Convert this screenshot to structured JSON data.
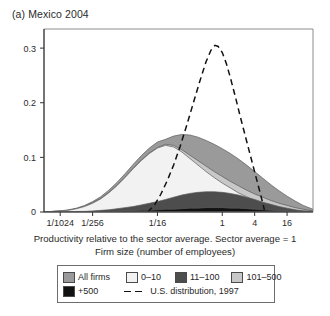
{
  "figure": {
    "panel_title": "(a) Mexico 2004",
    "caption_line1": "Productivity relative to the sector average. Sector average = 1",
    "caption_line2": "Firm size (number of employees)"
  },
  "legend": {
    "rows": [
      [
        {
          "label": "All firms",
          "swatch": "#9a9a9a",
          "type": "area"
        },
        {
          "label": "0–10",
          "swatch": "#f2f2f2",
          "type": "area"
        },
        {
          "label": "11–100",
          "swatch": "#4d4d4d",
          "type": "area"
        },
        {
          "label": "101–500",
          "swatch": "#c8c8c8",
          "type": "area"
        }
      ],
      [
        {
          "label": "+500",
          "swatch": "#111111",
          "type": "area"
        },
        {
          "label": "U.S. distribution, 1997",
          "swatch": "#111111",
          "type": "dashed-line"
        }
      ]
    ]
  },
  "chart_data": {
    "type": "area",
    "title": "(a) Mexico 2004",
    "xlabel": "Productivity relative to the sector average. Sector average = 1",
    "ylabel": "",
    "x_scale": "log2",
    "x_tick_labels": [
      "1/1024",
      "1/256",
      "1/16",
      "1",
      "4",
      "16"
    ],
    "x_tick_values": [
      0.0009765625,
      0.00390625,
      0.0625,
      1,
      4,
      16
    ],
    "x_tick_log2": [
      -10,
      -8,
      -4,
      0,
      2,
      4
    ],
    "xlim_log2": [
      -11,
      5.6
    ],
    "y_tick_labels": [
      "0",
      "0.1",
      "0.2",
      "0.3"
    ],
    "y_tick_values": [
      0,
      0.1,
      0.2,
      0.3
    ],
    "ylim": [
      0,
      0.335
    ],
    "grid": false,
    "legend_position": "below-axes",
    "x_log2": [
      -11,
      -10.5,
      -10,
      -9.5,
      -9,
      -8.5,
      -8,
      -7.5,
      -7,
      -6.5,
      -6,
      -5.5,
      -5,
      -4.5,
      -4,
      -3.5,
      -3,
      -2.5,
      -2,
      -1.5,
      -1,
      -0.5,
      0,
      0.5,
      1,
      1.5,
      2,
      2.5,
      3,
      3.5,
      4,
      4.5,
      5,
      5.6
    ],
    "series": [
      {
        "name": "All firms",
        "color": "#9a9a9a",
        "values": [
          0.0,
          0.001,
          0.002,
          0.004,
          0.007,
          0.012,
          0.019,
          0.028,
          0.04,
          0.054,
          0.07,
          0.087,
          0.103,
          0.117,
          0.128,
          0.133,
          0.139,
          0.142,
          0.141,
          0.137,
          0.131,
          0.124,
          0.116,
          0.107,
          0.097,
          0.086,
          0.074,
          0.062,
          0.05,
          0.039,
          0.029,
          0.02,
          0.012,
          0.005
        ]
      },
      {
        "name": "101–500",
        "color": "#c8c8c8",
        "values": [
          0.0,
          0.001,
          0.002,
          0.003,
          0.006,
          0.01,
          0.017,
          0.025,
          0.036,
          0.049,
          0.064,
          0.08,
          0.095,
          0.108,
          0.118,
          0.124,
          0.122,
          0.114,
          0.104,
          0.094,
          0.084,
          0.074,
          0.065,
          0.056,
          0.048,
          0.04,
          0.033,
          0.027,
          0.021,
          0.016,
          0.012,
          0.008,
          0.005,
          0.002
        ]
      },
      {
        "name": "0–10",
        "color": "#f2f2f2",
        "values": [
          0.0,
          0.001,
          0.002,
          0.003,
          0.006,
          0.01,
          0.016,
          0.024,
          0.035,
          0.048,
          0.063,
          0.079,
          0.094,
          0.107,
          0.117,
          0.122,
          0.119,
          0.11,
          0.098,
          0.086,
          0.074,
          0.063,
          0.053,
          0.044,
          0.035,
          0.028,
          0.021,
          0.016,
          0.011,
          0.008,
          0.005,
          0.003,
          0.002,
          0.001
        ]
      },
      {
        "name": "11–100",
        "color": "#4d4d4d",
        "values": [
          0.0,
          0.0,
          0.0,
          0.0,
          0.001,
          0.001,
          0.002,
          0.003,
          0.004,
          0.006,
          0.008,
          0.01,
          0.013,
          0.016,
          0.019,
          0.023,
          0.027,
          0.031,
          0.034,
          0.036,
          0.037,
          0.037,
          0.036,
          0.034,
          0.031,
          0.027,
          0.023,
          0.018,
          0.014,
          0.01,
          0.007,
          0.004,
          0.002,
          0.001
        ]
      },
      {
        "name": "+500",
        "color": "#111111",
        "values": [
          0.0,
          0.0,
          0.0,
          0.0,
          0.0,
          0.0,
          0.0,
          0.001,
          0.001,
          0.001,
          0.002,
          0.002,
          0.003,
          0.003,
          0.004,
          0.005,
          0.005,
          0.006,
          0.007,
          0.007,
          0.008,
          0.008,
          0.008,
          0.007,
          0.007,
          0.006,
          0.005,
          0.004,
          0.003,
          0.002,
          0.002,
          0.001,
          0.001,
          0.0
        ]
      }
    ],
    "dashed_series": {
      "name": "U.S. distribution, 1997",
      "color": "#111111",
      "style": "dashed",
      "x_log2": [
        -4.6,
        -4.2,
        -3.8,
        -3.4,
        -3.0,
        -2.6,
        -2.2,
        -1.8,
        -1.4,
        -1.0,
        -0.7,
        -0.45,
        -0.25,
        0.0,
        0.25,
        0.5,
        0.8,
        1.1,
        1.45,
        1.8,
        2.1,
        2.4,
        2.6
      ],
      "values": [
        0.0,
        0.012,
        0.032,
        0.057,
        0.086,
        0.12,
        0.158,
        0.198,
        0.238,
        0.275,
        0.296,
        0.305,
        0.303,
        0.292,
        0.272,
        0.246,
        0.212,
        0.176,
        0.136,
        0.096,
        0.062,
        0.028,
        0.004
      ]
    }
  }
}
